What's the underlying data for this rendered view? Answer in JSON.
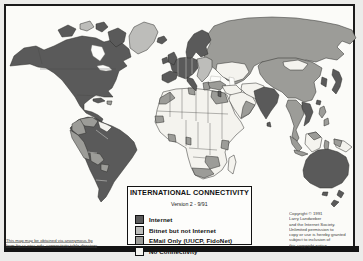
{
  "legend": {
    "title": "INTERNATIONAL CONNECTIVITY",
    "version": "Version 2  -  9/91",
    "items": [
      {
        "key": "internet",
        "label": "Internet",
        "color": "#5a5a5a"
      },
      {
        "key": "bitnet",
        "label": "Bitnet but not Internet",
        "color": "#bdbdba"
      },
      {
        "key": "email",
        "label": "EMail Only (UUCP, FidoNet)",
        "color": "#9c9c98"
      },
      {
        "key": "none",
        "label": "No Connectivity",
        "color": "#f4f3ee"
      }
    ]
  },
  "notes": {
    "ftp_note_line1": "This map may be obtained via anonymous ftp",
    "ftp_note_line2": "from ftp.cs.wisc.edu, connectivity table directory",
    "copyright": "Copyright © 1991\nLarry Landweber\nand the Internet Society.\nUnlimited permission to\ncopy or use is hereby granted\nsubject to inclusion of\nthis copyright notice."
  },
  "map": {
    "ocean_color": "#fbfbf8",
    "frame_color": "#1b1b1b",
    "bottom_bar_color": "#141414",
    "stroke_color": "#2d2d2b",
    "category_colors": {
      "internet": "#5a5a5a",
      "bitnet": "#bdbdba",
      "email": "#9c9c98",
      "none": "#f4f3ee",
      "water": "#fcfcfa"
    },
    "regions": [
      {
        "name": "ussr",
        "category": "email",
        "d": "M204,56 L210,44 L208,34 L214,26 L228,21 L248,18 L272,17 L296,18 L318,21 L338,25 L352,30 L356,38 L350,44 L342,41 L337,47 L344,54 L337,60 L326,58 L316,62 L306,60 L296,64 L284,62 L272,64 L262,62 L254,66 L250,74 L244,80 L236,84 L227,80 L219,72 L211,66 Z"
      },
      {
        "name": "central-asia",
        "category": "none",
        "d": "M217,64 L232,62 L245,64 L249,72 L243,79 L233,82 L223,77 L216,70 Z"
      },
      {
        "name": "caspian-sea",
        "category": "water",
        "d": "M229,77 L234,78 L235,88 L230,86 Z"
      },
      {
        "name": "black-sea",
        "category": "water",
        "d": "M211,76 L221,77 L220,82 L210,81 Z"
      },
      {
        "name": "china",
        "category": "email",
        "d": "M262,62 L278,58 L296,58 L312,62 L322,68 L320,76 L314,82 L316,92 L312,100 L304,102 L296,98 L288,98 L282,92 L274,88 L266,82 L260,74 L258,66 Z"
      },
      {
        "name": "mongolia",
        "category": "none",
        "d": "M283,62 L298,60 L308,64 L303,70 L290,70 L284,66 Z"
      },
      {
        "name": "north-america",
        "category": "internet",
        "d": "M10,66 L14,56 L24,48 L36,46 L44,50 L54,46 L66,40 L82,36 L96,38 L104,42 L112,40 L122,43 L129,49 L131,57 L123,61 L127,66 L119,71 L116,80 L112,88 L108,91 L113,97 L104,97 L96,95 L90,99 L84,104 L84,110 L92,112 L98,115 L103,119 L101,123 L94,117 L86,113 L80,106 L75,97 L69,89 L62,80 L54,73 L46,68 L38,67 L30,64 L20,65 Z"
      },
      {
        "name": "hudson-bay",
        "category": "water",
        "d": "M92,45 L102,47 L105,54 L100,61 L93,56 L91,50 Z"
      },
      {
        "name": "great-lakes",
        "category": "water",
        "d": "M97,66 L103,65 L109,67 L112,70 L106,71 L100,70 Z"
      },
      {
        "name": "baffin-island",
        "category": "internet",
        "d": "M108,32 L118,28 L126,33 L124,42 L116,47 L110,41 Z"
      },
      {
        "name": "arctic-island-west",
        "category": "internet",
        "d": "M58,30 L68,25 L76,29 L72,36 L62,37 Z"
      },
      {
        "name": "arctic-island-mid",
        "category": "bitnet",
        "d": "M80,24 L90,21 L94,27 L87,31 L80,29 Z"
      },
      {
        "name": "arctic-island-east",
        "category": "internet",
        "d": "M96,24 L104,22 L108,27 L102,32 L96,29 Z"
      },
      {
        "name": "greenland",
        "category": "bitnet",
        "d": "M130,48 L129,36 L134,27 L144,22 L154,25 L158,32 L154,42 L147,50 L138,54 Z"
      },
      {
        "name": "iceland",
        "category": "internet",
        "d": "M158,38 L164,36 L167,40 L162,44 L157,42 Z"
      },
      {
        "name": "south-america",
        "category": "internet",
        "d": "M78,120 L88,117 L97,119 L104,123 L112,126 L120,130 L128,136 L134,142 L137,150 L132,158 L126,166 L120,174 L114,182 L110,190 L106,197 L101,202 L98,197 L99,189 L95,180 L90,170 L85,158 L80,146 L74,136 L70,128 Z"
      },
      {
        "name": "venezuela",
        "category": "email",
        "d": "M80,119 L92,117 L98,121 L94,127 L85,126 L80,123 Z"
      },
      {
        "name": "guyanas",
        "category": "none",
        "d": "M98,121 L106,124 L112,127 L107,132 L100,128 Z"
      },
      {
        "name": "colombia",
        "category": "email",
        "d": "M72,124 L80,119 L84,126 L86,133 L78,135 L72,130 Z"
      },
      {
        "name": "peru-ecuador",
        "category": "email",
        "d": "M70,130 L78,135 L84,142 L88,152 L90,160 L84,158 L78,148 L72,138 Z"
      },
      {
        "name": "bolivia",
        "category": "email",
        "d": "M90,152 L100,154 L104,160 L98,165 L91,161 Z"
      },
      {
        "name": "paraguay",
        "category": "email",
        "d": "M101,164 L109,165 L107,172 L101,170 Z"
      },
      {
        "name": "africa",
        "category": "none",
        "d": "M163,92 L176,89 L192,88 L208,90 L220,92 L227,95 L231,104 L235,114 L241,122 L244,128 L236,135 L229,143 L225,152 L227,162 L222,170 L214,176 L203,179 L195,175 L191,167 L188,157 L186,148 L178,143 L168,139 L160,132 L155,122 L157,110 L160,100 Z"
      },
      {
        "name": "morocco",
        "category": "email",
        "d": "M160,98 L170,92 L175,98 L166,104 L159,104 Z"
      },
      {
        "name": "tunisia",
        "category": "email",
        "d": "M188,88 L194,88 L195,95 L189,94 Z"
      },
      {
        "name": "egypt",
        "category": "email",
        "d": "M212,91 L225,93 L228,102 L216,104 L211,97 Z"
      },
      {
        "name": "senegal",
        "category": "email",
        "d": "M155,116 L163,116 L164,122 L156,123 Z"
      },
      {
        "name": "cote-divoire",
        "category": "email",
        "d": "M168,134 L175,135 L176,142 L169,141 Z"
      },
      {
        "name": "cameroon",
        "category": "email",
        "d": "M186,137 L191,138 L191,145 L186,144 Z"
      },
      {
        "name": "kenya",
        "category": "email",
        "d": "M222,140 L229,141 L228,150 L221,148 Z"
      },
      {
        "name": "zambia-zimbabwe",
        "category": "email",
        "d": "M206,156 L218,157 L220,166 L210,169 L205,162 Z"
      },
      {
        "name": "south-africa",
        "category": "email",
        "d": "M192,168 L210,169 L214,174 L204,178 L195,175 Z"
      },
      {
        "name": "madagascar",
        "category": "none",
        "d": "M229,158 L234,155 L236,162 L233,174 L228,170 Z"
      },
      {
        "name": "europe-west",
        "category": "internet",
        "d": "M170,62 L180,58 L190,57 L197,60 L198,68 L193,74 L186,79 L178,76 L172,70 Z"
      },
      {
        "name": "uk",
        "category": "internet",
        "d": "M168,55 L174,52 L177,58 L174,65 L168,62 Z"
      },
      {
        "name": "ireland",
        "category": "internet",
        "d": "M162,59 L167,57 L168,62 L163,64 Z"
      },
      {
        "name": "scandinavia",
        "category": "internet",
        "d": "M186,52 L188,42 L194,34 L202,30 L208,33 L211,40 L206,47 L208,54 L201,57 L196,52 L192,58 L187,58 Z"
      },
      {
        "name": "iberia",
        "category": "internet",
        "d": "M162,75 L170,71 L178,73 L176,79 L168,83 L162,80 Z"
      },
      {
        "name": "italy",
        "category": "internet",
        "d": "M187,77 L193,79 L197,86 L196,91 L191,86 L187,81 Z"
      },
      {
        "name": "europe-east",
        "category": "bitnet",
        "d": "M197,59 L206,57 L212,60 L212,68 L208,76 L202,82 L197,76 L199,68 Z"
      },
      {
        "name": "greece",
        "category": "email",
        "d": "M203,83 L209,82 L210,89 L204,90 Z"
      },
      {
        "name": "turkey",
        "category": "email",
        "d": "M208,83 L220,81 L226,85 L220,90 L210,88 Z"
      },
      {
        "name": "middle-east",
        "category": "none",
        "d": "M222,86 L236,85 L242,91 L236,97 L226,93 Z"
      },
      {
        "name": "israel",
        "category": "internet",
        "d": "M218,91 L221,91 L221,97 L218,96 Z"
      },
      {
        "name": "arabia",
        "category": "none",
        "d": "M230,95 L242,92 L252,96 L256,103 L250,113 L241,119 L234,109 L229,100 Z"
      },
      {
        "name": "arabia-south",
        "category": "email",
        "d": "M246,101 L255,105 L249,114 L241,118 L243,107 Z"
      },
      {
        "name": "iran-afghanistan",
        "category": "none",
        "d": "M242,84 L256,83 L264,86 L264,95 L256,99 L246,94 L241,89 Z"
      },
      {
        "name": "india",
        "category": "internet",
        "d": "M254,91 L264,87 L274,89 L279,95 L277,103 L271,111 L266,119 L261,111 L256,101 Z"
      },
      {
        "name": "sri-lanka",
        "category": "internet",
        "d": "M267,123 L270,122 L271,127 L267,126 Z"
      },
      {
        "name": "korea",
        "category": "internet",
        "d": "M322,77 L327,79 L326,87 L321,84 Z"
      },
      {
        "name": "japan",
        "category": "internet",
        "d": "M333,69 L339,72 L342,79 L340,87 L336,94 L332,90 L336,82 L332,75 Z"
      },
      {
        "name": "taiwan",
        "category": "internet",
        "d": "M317,100 L321,101 L320,105 L316,104 Z"
      },
      {
        "name": "southeast-asia",
        "category": "email",
        "d": "M288,100 L296,100 L302,106 L304,114 L300,122 L296,130 L299,138 L296,143 L292,136 L294,126 L290,114 L286,106 Z"
      },
      {
        "name": "vietnam",
        "category": "internet",
        "d": "M302,102 L310,104 L313,112 L309,122 L304,126 L306,116 L302,108 Z"
      },
      {
        "name": "philippines",
        "category": "email",
        "d": "M320,108 L324,106 L326,112 L322,118 L319,114 Z M324,120 L328,118 L329,124 L324,126 Z"
      },
      {
        "name": "sumatra",
        "category": "email",
        "d": "M290,136 L296,140 L302,148 L298,152 L292,144 Z"
      },
      {
        "name": "borneo",
        "category": "none",
        "d": "M306,134 L316,132 L322,138 L320,148 L312,152 L305,144 Z"
      },
      {
        "name": "borneo-north",
        "category": "email",
        "d": "M308,134 L316,132 L321,137 L314,140 Z"
      },
      {
        "name": "java",
        "category": "email",
        "d": "M294,150 L303,152 L308,154 L302,156 L295,153 Z"
      },
      {
        "name": "sulawesi",
        "category": "email",
        "d": "M325,140 L329,142 L328,150 L331,154 L326,153 L324,146 Z"
      },
      {
        "name": "new-guinea",
        "category": "none",
        "d": "M334,139 L344,141 L352,147 L346,152 L336,147 Z"
      },
      {
        "name": "new-guinea-west",
        "category": "email",
        "d": "M334,139 L342,141 L340,147 L334,144 Z"
      },
      {
        "name": "australia",
        "category": "internet",
        "d": "M303,170 L306,160 L310,155 L318,150 L328,149 L338,152 L346,157 L349,165 L348,175 L342,183 L332,188 L320,188 L310,183 L304,177 Z"
      },
      {
        "name": "tasmania",
        "category": "internet",
        "d": "M323,192 L328,192 L327,196 L322,195 Z"
      },
      {
        "name": "new-zealand",
        "category": "internet",
        "d": "M339,190 L344,193 L341,198 L337,195 Z M334,200 L339,202 L334,207 L331,204 Z"
      },
      {
        "name": "cuba",
        "category": "internet",
        "d": "M93,99 L101,98 L105,101 L98,103 L93,101 Z"
      },
      {
        "name": "hispaniola",
        "category": "email",
        "d": "M107,101 L112,101 L111,105 L107,104 Z"
      },
      {
        "name": "africa-country-borders",
        "category": "border",
        "d": "M170,92 L170,117 M182,89 L182,119 M196,89 L196,121 M208,90 L208,123 M157,111 L228,114 M186,120 L186,146 M198,122 L198,148 M210,123 L210,155 M222,103 L222,139 M189,148 L217,150 M193,157 L206,158"
      },
      {
        "name": "south-america-borders",
        "category": "border-light",
        "d": "M96,130 L108,139 M88,152 L97,153 M96,180 L107,181"
      },
      {
        "name": "europe-borders",
        "category": "border-light",
        "d": "M178,58 L178,76 M186,57 L186,79 M192,58 L192,74"
      },
      {
        "name": "us-canada-border",
        "category": "border",
        "d": "M40,69 L116,69"
      },
      {
        "name": "us-mexico-border",
        "category": "border",
        "d": "M77,95 L100,96"
      },
      {
        "name": "alaska-canada-border",
        "category": "border",
        "d": "M38,48 L42,64"
      }
    ]
  }
}
